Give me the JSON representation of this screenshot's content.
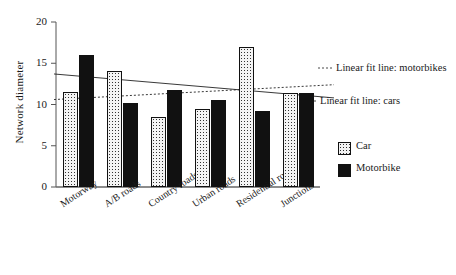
{
  "chart_data": {
    "type": "bar",
    "title": "",
    "xlabel": "",
    "ylabel": "Network diameter",
    "ylim": [
      0,
      20
    ],
    "yticks": [
      0,
      5,
      10,
      15,
      20
    ],
    "grid": false,
    "legend_position": "right",
    "categories": [
      "Motorway",
      "A/B roads",
      "Country roads",
      "Urban roads",
      "Residential roads",
      "Junctions"
    ],
    "series": [
      {
        "name": "Car",
        "values": [
          11.5,
          14.1,
          8.5,
          9.4,
          17.0,
          11.4
        ]
      },
      {
        "name": "Motorbike",
        "values": [
          16.0,
          10.2,
          11.7,
          10.5,
          9.2,
          11.4
        ]
      }
    ],
    "trendlines": [
      {
        "name": "Linear fit line: motorbikes",
        "style": "dotted",
        "y_start": 10.6,
        "y_end": 12.4
      },
      {
        "name": "Linear fit line: cars",
        "style": "solid",
        "y_start": 13.7,
        "y_end": 10.8
      }
    ],
    "annotations": [
      {
        "text": "Linear fit line: motorbikes"
      },
      {
        "text": "Linear fit line: cars"
      }
    ]
  },
  "axis": {
    "y_label": "Network diameter",
    "y_ticks": [
      "0",
      "5",
      "10",
      "15",
      "20"
    ]
  },
  "legend": {
    "entries": [
      {
        "label": "Car",
        "color": "#f4f4f4"
      },
      {
        "label": "Motorbike",
        "color": "#111111"
      }
    ]
  },
  "colors": {
    "car": "#f4f4f4",
    "motorbike": "#111111",
    "axis": "#555555",
    "text": "#1a1a1a"
  }
}
